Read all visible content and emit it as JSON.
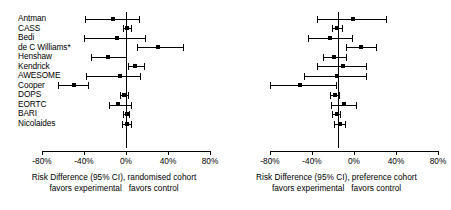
{
  "figure": {
    "type": "forest-plot-pair",
    "x_axis": {
      "ticks": [
        -80,
        -40,
        0,
        40,
        80
      ],
      "tick_labels": [
        "-80%",
        "-40%",
        "0%",
        "40%",
        "80%"
      ],
      "min": -80,
      "max": 80,
      "null_value": 0
    },
    "studies": [
      "Antman",
      "CASS",
      "Bedi",
      "de C Williams*",
      "Henshaw",
      "Kendrick",
      "AWESOME",
      "Cooper",
      "DOPS",
      "EORTC",
      "BARI",
      "Nicolaides"
    ]
  },
  "panels": [
    {
      "id": "randomised",
      "caption_main": "Risk Difference (95% CI), randomised cohort",
      "caption_left": "favors experimental",
      "caption_right": "favors control"
    },
    {
      "id": "preference",
      "caption_main": "Risk Difference (95% CI), preference cohort",
      "caption_left": "favors experimental",
      "caption_right": "favors control"
    }
  ],
  "chart_data": {
    "type": "forest",
    "title": "",
    "xlabel": "Risk Difference (95% CI)",
    "ylabel": "",
    "xlim": [
      -80,
      80
    ],
    "xticks": [
      -80,
      -40,
      0,
      40,
      80
    ],
    "xtick_labels": [
      "-80%",
      "-40%",
      "0%",
      "40%",
      "80%"
    ],
    "reference_line": 0,
    "grid": false,
    "legend": "none",
    "units": "percent",
    "categories": [
      "Antman",
      "CASS",
      "Bedi",
      "de C Williams*",
      "Henshaw",
      "Kendrick",
      "AWESOME",
      "Cooper",
      "DOPS",
      "EORTC",
      "BARI",
      "Nicolaides"
    ],
    "series": [
      {
        "name": "randomised cohort",
        "panel": "left",
        "points": [
          {
            "study": "Antman",
            "estimate": -12.0,
            "ci_low": -39.0,
            "ci_high": 13.0
          },
          {
            "study": "CASS",
            "estimate": 1.0,
            "ci_low": -3.0,
            "ci_high": 6.0
          },
          {
            "study": "Bedi",
            "estimate": -9.0,
            "ci_low": -40.0,
            "ci_high": 19.0
          },
          {
            "study": "de C Williams*",
            "estimate": 30.0,
            "ci_low": 10.0,
            "ci_high": 55.0
          },
          {
            "study": "Henshaw",
            "estimate": -17.0,
            "ci_low": -33.0,
            "ci_high": 1.0
          },
          {
            "study": "Kendrick",
            "estimate": 9.0,
            "ci_low": 2.0,
            "ci_high": 18.0
          },
          {
            "study": "AWESOME",
            "estimate": -6.0,
            "ci_low": -38.0,
            "ci_high": 14.0
          },
          {
            "study": "Cooper",
            "estimate": -50.0,
            "ci_low": -65.0,
            "ci_high": -35.0
          },
          {
            "study": "DOPS",
            "estimate": -2.0,
            "ci_low": -6.0,
            "ci_high": 3.0
          },
          {
            "study": "EORTC",
            "estimate": -8.0,
            "ci_low": -16.0,
            "ci_high": 6.0
          },
          {
            "study": "BARI",
            "estimate": 1.0,
            "ci_low": -3.0,
            "ci_high": 4.0
          },
          {
            "study": "Nicolaides",
            "estimate": 1.0,
            "ci_low": -4.0,
            "ci_high": 6.0
          }
        ]
      },
      {
        "name": "preference cohort",
        "panel": "right",
        "points": [
          {
            "study": "Antman",
            "estimate": 14.0,
            "ci_low": -20.0,
            "ci_high": 47.0
          },
          {
            "study": "CASS",
            "estimate": -1.0,
            "ci_low": -6.0,
            "ci_high": 5.0
          },
          {
            "study": "Bedi",
            "estimate": -8.0,
            "ci_low": -29.0,
            "ci_high": 14.0
          },
          {
            "study": "de C Williams*",
            "estimate": 22.0,
            "ci_low": 8.0,
            "ci_high": 37.0
          },
          {
            "study": "Henshaw",
            "estimate": -4.0,
            "ci_low": -14.0,
            "ci_high": 9.0
          },
          {
            "study": "Kendrick",
            "estimate": 5.0,
            "ci_low": -20.0,
            "ci_high": 28.0
          },
          {
            "study": "AWESOME",
            "estimate": -1.0,
            "ci_low": -32.0,
            "ci_high": 28.0
          },
          {
            "study": "Cooper",
            "estimate": -36.0,
            "ci_low": -65.0,
            "ci_high": -1.0
          },
          {
            "study": "DOPS",
            "estimate": -3.0,
            "ci_low": -8.0,
            "ci_high": 2.0
          },
          {
            "study": "EORTC",
            "estimate": 6.0,
            "ci_low": -7.0,
            "ci_high": 18.0
          },
          {
            "study": "BARI",
            "estimate": -1.0,
            "ci_low": -6.0,
            "ci_high": 3.0
          },
          {
            "study": "Nicolaides",
            "estimate": 2.0,
            "ci_low": -4.0,
            "ci_high": 8.0
          }
        ]
      }
    ]
  }
}
